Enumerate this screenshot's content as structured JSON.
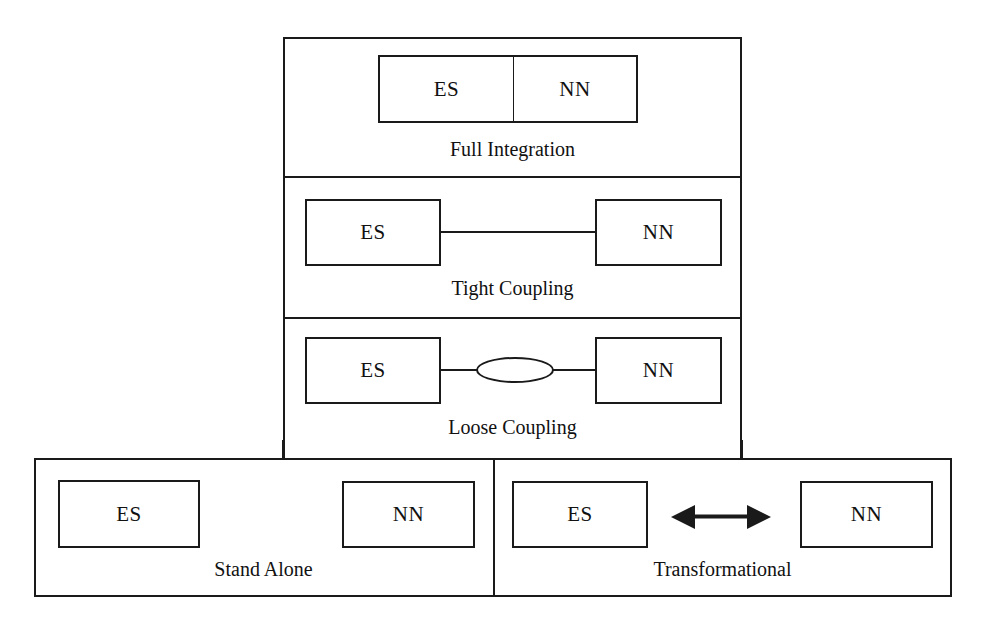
{
  "diagram": {
    "node_labels": {
      "es": "ES",
      "nn": "NN"
    },
    "panels": [
      {
        "id": "full-integration",
        "caption": "Full Integration",
        "coupling": "fused",
        "nodes": [
          "ES",
          "NN"
        ],
        "connector": "shared-border"
      },
      {
        "id": "tight-coupling",
        "caption": "Tight Coupling",
        "coupling": "tight",
        "nodes": [
          "ES",
          "NN"
        ],
        "connector": "line"
      },
      {
        "id": "loose-coupling",
        "caption": "Loose Coupling",
        "coupling": "loose",
        "nodes": [
          "ES",
          "NN"
        ],
        "connector": "line-with-ellipse"
      },
      {
        "id": "stand-alone",
        "caption": "Stand Alone",
        "coupling": "none",
        "nodes": [
          "ES",
          "NN"
        ],
        "connector": "none"
      },
      {
        "id": "transformational",
        "caption": "Transformational",
        "coupling": "transformational",
        "nodes": [
          "ES",
          "NN"
        ],
        "connector": "double-headed-arrow"
      }
    ],
    "colors": {
      "stroke": "#1a1a1a",
      "background": "#ffffff",
      "text": "#111111"
    }
  }
}
